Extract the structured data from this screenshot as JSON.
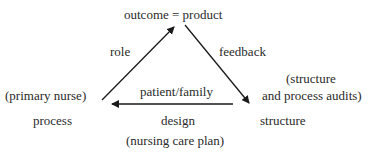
{
  "diagram": {
    "top_node": "outcome = product",
    "left_node": "process",
    "left_note": "(primary nurse)",
    "right_node": "structure",
    "right_note_line1": "(structure",
    "right_note_line2": "and process audits)",
    "edges": {
      "left_up": "role",
      "right_down": "feedback",
      "bottom_top_label": "patient/family",
      "bottom_bottom_label": "design",
      "bottom_note": "(nursing care plan)"
    }
  },
  "colors": {
    "ink": "#2a2a2a",
    "background": "#ffffff"
  }
}
